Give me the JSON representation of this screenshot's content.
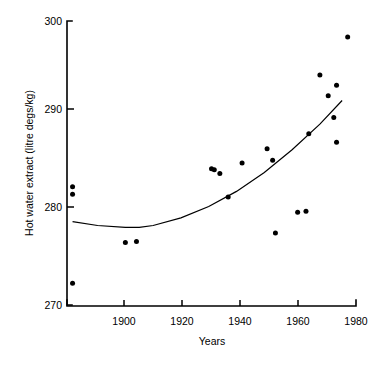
{
  "chart_data": {
    "type": "scatter",
    "title": "",
    "subtitle": "",
    "xlabel": "Years",
    "ylabel": "Hot water extract (litre degs/kg)",
    "xlim": [
      1879,
      1983
    ],
    "ylim": [
      270,
      300
    ],
    "xticks": [
      1900,
      1920,
      1940,
      1960,
      1980
    ],
    "xticklabels": [
      "1900",
      "1920",
      "1940",
      "1960",
      "1980"
    ],
    "yticks": [
      270,
      280,
      290,
      300
    ],
    "yticklabels": [
      "270",
      "280",
      "290",
      "300"
    ],
    "grid": false,
    "legend": null,
    "marker": "filled-circle",
    "marker_color": "#000000",
    "points": [
      {
        "x": 1881,
        "y": 282.5
      },
      {
        "x": 1881,
        "y": 281.7
      },
      {
        "x": 1881,
        "y": 272.3
      },
      {
        "x": 1900,
        "y": 276.6
      },
      {
        "x": 1904,
        "y": 276.7
      },
      {
        "x": 1931,
        "y": 284.4
      },
      {
        "x": 1932,
        "y": 284.3
      },
      {
        "x": 1934,
        "y": 283.9
      },
      {
        "x": 1937,
        "y": 281.4
      },
      {
        "x": 1942,
        "y": 285.0
      },
      {
        "x": 1951,
        "y": 286.5
      },
      {
        "x": 1953,
        "y": 285.3
      },
      {
        "x": 1954,
        "y": 277.6
      },
      {
        "x": 1962,
        "y": 279.8
      },
      {
        "x": 1965,
        "y": 279.9
      },
      {
        "x": 1966,
        "y": 288.1
      },
      {
        "x": 1970,
        "y": 294.3
      },
      {
        "x": 1973,
        "y": 292.1
      },
      {
        "x": 1975,
        "y": 289.8
      },
      {
        "x": 1976,
        "y": 293.2
      },
      {
        "x": 1976,
        "y": 287.2
      },
      {
        "x": 1980,
        "y": 298.3
      }
    ],
    "fit_curve": {
      "name": "quadratic-trend",
      "points": [
        {
          "x": 1881,
          "y": 278.8
        },
        {
          "x": 1890,
          "y": 278.4
        },
        {
          "x": 1900,
          "y": 278.2
        },
        {
          "x": 1905,
          "y": 278.2
        },
        {
          "x": 1910,
          "y": 278.4
        },
        {
          "x": 1920,
          "y": 279.2
        },
        {
          "x": 1930,
          "y": 280.4
        },
        {
          "x": 1940,
          "y": 282.0
        },
        {
          "x": 1950,
          "y": 284.0
        },
        {
          "x": 1960,
          "y": 286.4
        },
        {
          "x": 1970,
          "y": 289.1
        },
        {
          "x": 1978,
          "y": 291.6
        }
      ]
    }
  }
}
